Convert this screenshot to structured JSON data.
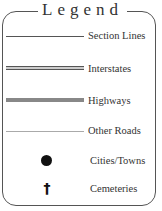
{
  "legend": {
    "title": "Legend",
    "items": [
      {
        "label": "Section Lines",
        "symbol": "thin-line"
      },
      {
        "label": "Interstates",
        "symbol": "double-line"
      },
      {
        "label": "Highways",
        "symbol": "thick-gray-line"
      },
      {
        "label": "Other Roads",
        "symbol": "light-thin-line"
      },
      {
        "label": "Cities/Towns",
        "symbol": "filled-circle"
      },
      {
        "label": "Cemeteries",
        "symbol": "cross",
        "glyph": "†"
      }
    ]
  },
  "colors": {
    "border": "#555555",
    "text": "#333333",
    "highway": "#888888",
    "other_roads": "#aaaaaa"
  }
}
